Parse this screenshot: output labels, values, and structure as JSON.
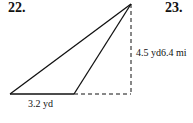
{
  "problems": [
    {
      "number": "22.",
      "figure": {
        "type": "obtuse-triangle-with-height",
        "vertices": {
          "apex": [
            131,
            4
          ],
          "base_left": [
            10,
            94
          ],
          "base_right": [
            74,
            94
          ],
          "height_foot": [
            131,
            94
          ]
        },
        "base_label": "3.2 yd",
        "height_label": "4.5 yd"
      }
    },
    {
      "number": "23.",
      "partial_label": "6.4 mi"
    }
  ],
  "colors": {
    "stroke": "#111111",
    "background": "#ffffff"
  }
}
